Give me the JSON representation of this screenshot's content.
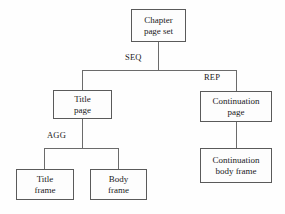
{
  "diagram": {
    "style": {
      "background": "#fefefe",
      "box_border": "#5a5a5a",
      "box_fill": "#fdfdfd",
      "line_color": "#6b6b6b",
      "text_color": "#1a1a1a"
    },
    "nodes": [
      {
        "id": "chapter-page-set",
        "label": "Chapter\npage set"
      },
      {
        "id": "title-page",
        "label": "Title\npage"
      },
      {
        "id": "continuation-page",
        "label": "Continuation\npage"
      },
      {
        "id": "title-frame",
        "label": "Title\nframe"
      },
      {
        "id": "body-frame",
        "label": "Body\nframe"
      },
      {
        "id": "continuation-body-frame",
        "label": "Continuation\nbody frame"
      }
    ],
    "edge_labels": [
      {
        "id": "seq",
        "text": "SEQ"
      },
      {
        "id": "rep",
        "text": "REP"
      },
      {
        "id": "agg",
        "text": "AGG"
      }
    ]
  }
}
